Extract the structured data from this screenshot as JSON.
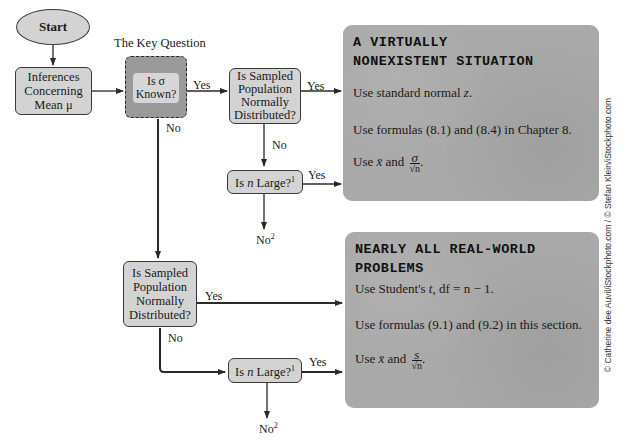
{
  "flowchart": {
    "start": "Start",
    "inference_box": {
      "line1": "Inferences",
      "line2": "Concerning",
      "line3": "Mean μ"
    },
    "key_question_title": "The Key Question",
    "key_question": {
      "line1": "Is σ",
      "line2": "Known?"
    },
    "normal_top": {
      "line1": "Is Sampled",
      "line2": "Population",
      "line3": "Normally",
      "line4": "Distributed?"
    },
    "n_large_top": {
      "prefix": "Is ",
      "var": "n",
      "suffix": " Large?",
      "sup": "1"
    },
    "normal_bottom": {
      "line1": "Is Sampled",
      "line2": "Population",
      "line3": "Normally",
      "line4": "Distributed?"
    },
    "n_large_bottom": {
      "prefix": "Is ",
      "var": "n",
      "suffix": " Large?",
      "sup": "1"
    },
    "edge_labels": {
      "yes": "Yes",
      "no": "No",
      "no2_text": "No",
      "no2_sup": "2"
    }
  },
  "panels": [
    {
      "title_line1": "A VIRTUALLY",
      "title_line2": "NONEXISTENT SITUATION",
      "line1_text": "Use standard normal ",
      "line1_var": "z",
      "line1_end": ".",
      "line2": "Use formulas (8.1) and (8.4) in Chapter 8.",
      "line3_prefix": "Use ",
      "line3_var": "x̄",
      "line3_mid": " and ",
      "frac_num": "σ",
      "frac_den": "√n",
      "line3_end": "."
    },
    {
      "title_line1": "NEARLY ALL REAL-WORLD",
      "title_line2": "PROBLEMS",
      "line1_text": "Use Student's ",
      "line1_var": "t",
      "line1_end": ", df = n − 1.",
      "line2": "Use formulas (9.1) and (9.2) in this section.",
      "line3_prefix": "Use ",
      "line3_var": "x̄",
      "line3_mid": " and ",
      "frac_num": "s",
      "frac_den": "√n",
      "line3_end": "."
    }
  ],
  "credit": "© Catherine dee Auvil/iStockphoto.com / © Stefan Klein/iStockphoto.com",
  "colors": {
    "node_fill": "#d3d3d3",
    "key_fill": "#9a9a9a",
    "panel_fill": "#a9a9a9",
    "line": "#2a2a2a"
  }
}
